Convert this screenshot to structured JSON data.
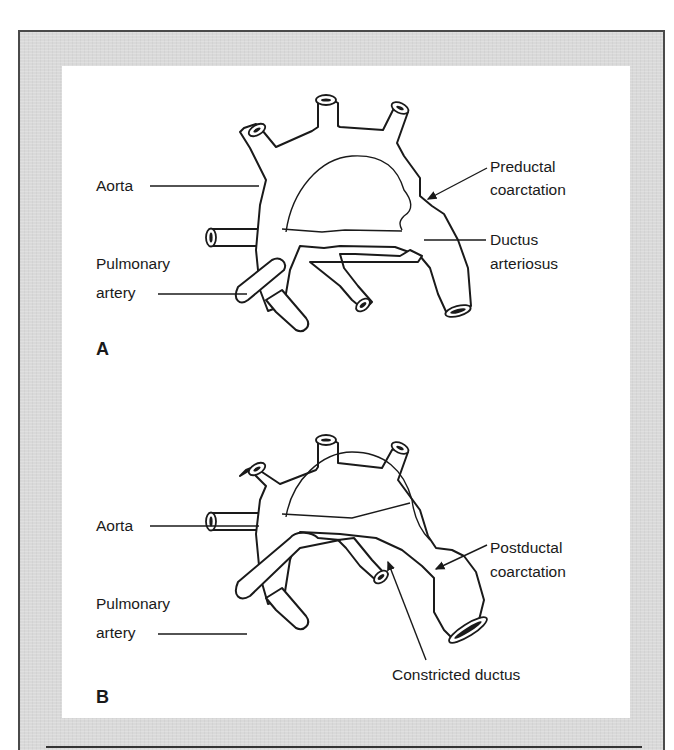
{
  "figure": {
    "panel_a": {
      "part_label": "A",
      "labels": {
        "aorta": "Aorta",
        "pulmonary_artery_line1": "Pulmonary",
        "pulmonary_artery_line2": "artery",
        "coarctation_line1": "Preductal",
        "coarctation_line2": "coarctation",
        "ductus_line1": "Ductus",
        "ductus_line2": "arteriosus"
      }
    },
    "panel_b": {
      "part_label": "B",
      "labels": {
        "aorta": "Aorta",
        "pulmonary_artery_line1": "Pulmonary",
        "pulmonary_artery_line2": "artery",
        "coarctation_line1": "Postductal",
        "coarctation_line2": "coarctation",
        "ductus": "Constricted ductus"
      }
    },
    "colors": {
      "frame_bg": "#d9d9d9",
      "panel_bg": "#ffffff",
      "ink": "#1a1a1a"
    }
  }
}
